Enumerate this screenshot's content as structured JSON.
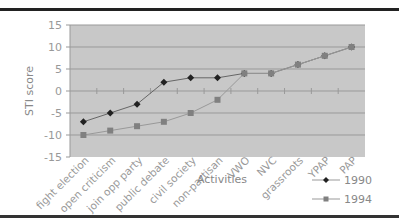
{
  "chart_data": {
    "type": "line",
    "title": "",
    "xlabel": "Activities",
    "ylabel": "STI score",
    "ylim": [
      -15,
      15
    ],
    "yticks": [
      15,
      10,
      5,
      0,
      -5,
      -10,
      -15
    ],
    "categories": [
      "fight election",
      "open criticism",
      "join opp party",
      "public debate",
      "civil society",
      "non-partisan",
      "VWO",
      "NVC",
      "grassroots",
      "YPAP",
      "PAP"
    ],
    "series": [
      {
        "name": "1990",
        "marker": "diamond",
        "color": "#222222",
        "values": [
          -7,
          -5,
          -3,
          2,
          3,
          3,
          4,
          4,
          6,
          8,
          10
        ]
      },
      {
        "name": "1994",
        "marker": "square",
        "color": "#808080",
        "values": [
          -10,
          -9,
          -8,
          -7,
          -5,
          -2,
          4,
          4,
          6,
          8,
          10
        ]
      }
    ],
    "legend_position": "bottom-right",
    "grid": true
  },
  "colors": {
    "plot_bg": "#c8c8c8",
    "grid": "#999999"
  }
}
